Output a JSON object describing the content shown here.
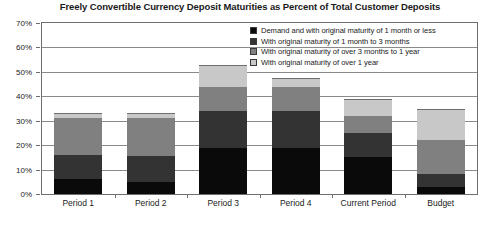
{
  "chart_data": {
    "type": "bar",
    "title": "Freely Convertible Currency Deposit Maturities as Percent of Total Customer Deposits",
    "xlabel": "",
    "ylabel": "",
    "ylim": [
      0,
      70
    ],
    "ytick_labels": [
      "0%",
      "10%",
      "20%",
      "30%",
      "40%",
      "50%",
      "60%",
      "70%"
    ],
    "ytick_values": [
      0,
      10,
      20,
      30,
      40,
      50,
      60,
      70
    ],
    "grid": true,
    "stacked": true,
    "legend_position": "upper-right-inside",
    "categories": [
      "Period 1",
      "Period 2",
      "Period 3",
      "Period 4",
      "Current Period",
      "Budget"
    ],
    "series": [
      {
        "name": "Demand and with original maturity of 1 month or less",
        "color": "#0a0a0a",
        "values": [
          6,
          5,
          19,
          19,
          15,
          3
        ]
      },
      {
        "name": "With original maturity of 1 month to 3 months",
        "color": "#333333",
        "values": [
          10,
          10.5,
          15,
          15,
          10,
          5
        ]
      },
      {
        "name": "With original maturity of over 3 months to 1 year",
        "color": "#808080",
        "values": [
          15,
          15.5,
          10,
          10,
          7,
          14
        ]
      },
      {
        "name": "With original maturity of over 1 year",
        "color": "#c8c8c8",
        "values": [
          2,
          2,
          9,
          3.5,
          7,
          13
        ]
      }
    ],
    "totals": [
      33,
      33,
      53,
      47.5,
      39,
      35
    ]
  }
}
